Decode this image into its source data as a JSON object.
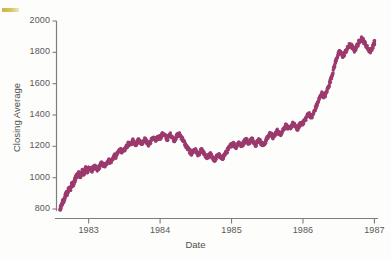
{
  "chart_data": {
    "type": "scatter",
    "title": "",
    "xlabel": "Date",
    "ylabel": "Closing Average",
    "xlim": [
      1982.55,
      1987.05
    ],
    "ylim": [
      760,
      2010
    ],
    "grid": false,
    "legend": null,
    "xtick_labels": [
      "1983",
      "1984",
      "1985",
      "1986",
      "1987"
    ],
    "xtick_values": [
      1983,
      1984,
      1985,
      1986,
      1987
    ],
    "ytick_labels": [
      "800",
      "1000",
      "1200",
      "1400",
      "1600",
      "1800",
      "2000"
    ],
    "ytick_values": [
      800,
      1000,
      1200,
      1400,
      1600,
      1800,
      2000
    ],
    "marker_color": "#9c3a6e",
    "marker_size": 1.7,
    "series_name": "Dow Jones closing average",
    "x": [
      1982.6,
      1982.61,
      1982.62,
      1982.63,
      1982.64,
      1982.65,
      1982.66,
      1982.67,
      1982.68,
      1982.69,
      1982.7,
      1982.71,
      1982.72,
      1982.73,
      1982.74,
      1982.75,
      1982.76,
      1982.77,
      1982.78,
      1982.79,
      1982.8,
      1982.81,
      1982.82,
      1982.83,
      1982.84,
      1982.85,
      1982.86,
      1982.87,
      1982.88,
      1982.89,
      1982.9,
      1982.91,
      1982.92,
      1982.93,
      1982.94,
      1982.95,
      1982.96,
      1982.97,
      1982.98,
      1982.99,
      1983.0,
      1983.02,
      1983.04,
      1983.06,
      1983.08,
      1983.1,
      1983.12,
      1983.14,
      1983.16,
      1983.18,
      1983.2,
      1983.22,
      1983.24,
      1983.26,
      1983.28,
      1983.3,
      1983.32,
      1983.34,
      1983.36,
      1983.38,
      1983.4,
      1983.42,
      1983.44,
      1983.46,
      1983.48,
      1983.5,
      1983.52,
      1983.54,
      1983.56,
      1983.58,
      1983.6,
      1983.62,
      1983.64,
      1983.66,
      1983.68,
      1983.7,
      1983.72,
      1983.74,
      1983.76,
      1983.78,
      1983.8,
      1983.82,
      1983.84,
      1983.86,
      1983.88,
      1983.9,
      1983.92,
      1983.94,
      1983.96,
      1983.98,
      1984.0,
      1984.02,
      1984.04,
      1984.06,
      1984.08,
      1984.1,
      1984.12,
      1984.14,
      1984.16,
      1984.18,
      1984.2,
      1984.22,
      1984.24,
      1984.26,
      1984.28,
      1984.3,
      1984.32,
      1984.34,
      1984.36,
      1984.38,
      1984.4,
      1984.42,
      1984.44,
      1984.46,
      1984.48,
      1984.5,
      1984.52,
      1984.54,
      1984.56,
      1984.58,
      1984.6,
      1984.62,
      1984.64,
      1984.66,
      1984.68,
      1984.7,
      1984.72,
      1984.74,
      1984.76,
      1984.78,
      1984.8,
      1984.82,
      1984.84,
      1984.86,
      1984.88,
      1984.9,
      1984.92,
      1984.94,
      1984.96,
      1984.98,
      1985.0,
      1985.02,
      1985.04,
      1985.06,
      1985.08,
      1985.1,
      1985.12,
      1985.14,
      1985.16,
      1985.18,
      1985.2,
      1985.22,
      1985.24,
      1985.26,
      1985.28,
      1985.3,
      1985.32,
      1985.34,
      1985.36,
      1985.38,
      1985.4,
      1985.42,
      1985.44,
      1985.46,
      1985.48,
      1985.5,
      1985.52,
      1985.54,
      1985.56,
      1985.58,
      1985.6,
      1985.62,
      1985.64,
      1985.66,
      1985.68,
      1985.7,
      1985.72,
      1985.74,
      1985.76,
      1985.78,
      1985.8,
      1985.82,
      1985.84,
      1985.86,
      1985.88,
      1985.9,
      1985.92,
      1985.94,
      1985.96,
      1985.98,
      1986.0,
      1986.02,
      1986.04,
      1986.06,
      1986.08,
      1986.1,
      1986.12,
      1986.14,
      1986.16,
      1986.18,
      1986.2,
      1986.22,
      1986.24,
      1986.26,
      1986.28,
      1986.3,
      1986.32,
      1986.34,
      1986.36,
      1986.38,
      1986.4,
      1986.42,
      1986.44,
      1986.46,
      1986.48,
      1986.5,
      1986.52,
      1986.54,
      1986.56,
      1986.58,
      1986.6,
      1986.62,
      1986.64,
      1986.66,
      1986.68,
      1986.7,
      1986.72,
      1986.74,
      1986.76,
      1986.78,
      1986.8,
      1986.82,
      1986.84,
      1986.86,
      1986.88,
      1986.9,
      1986.92,
      1986.94,
      1986.96,
      1986.98,
      1987.0
    ],
    "y": [
      795,
      808,
      822,
      838,
      852,
      845,
      862,
      878,
      890,
      903,
      896,
      912,
      928,
      941,
      920,
      934,
      950,
      962,
      948,
      958,
      975,
      990,
      1002,
      1015,
      1008,
      1022,
      1030,
      1018,
      1005,
      1016,
      1028,
      1042,
      1035,
      1020,
      1032,
      1048,
      1060,
      1045,
      1038,
      1052,
      1065,
      1055,
      1042,
      1058,
      1072,
      1060,
      1048,
      1062,
      1078,
      1090,
      1082,
      1070,
      1086,
      1100,
      1112,
      1098,
      1108,
      1125,
      1140,
      1132,
      1150,
      1168,
      1182,
      1172,
      1160,
      1175,
      1192,
      1205,
      1218,
      1208,
      1222,
      1238,
      1225,
      1212,
      1228,
      1242,
      1230,
      1218,
      1232,
      1245,
      1238,
      1222,
      1210,
      1225,
      1240,
      1255,
      1248,
      1235,
      1250,
      1262,
      1255,
      1268,
      1280,
      1272,
      1258,
      1245,
      1262,
      1275,
      1268,
      1252,
      1240,
      1255,
      1268,
      1280,
      1272,
      1258,
      1240,
      1222,
      1205,
      1190,
      1178,
      1165,
      1152,
      1168,
      1180,
      1172,
      1158,
      1145,
      1160,
      1175,
      1162,
      1148,
      1135,
      1122,
      1138,
      1150,
      1140,
      1126,
      1112,
      1125,
      1138,
      1148,
      1132,
      1118,
      1130,
      1145,
      1158,
      1172,
      1185,
      1198,
      1212,
      1222,
      1208,
      1195,
      1210,
      1225,
      1215,
      1202,
      1218,
      1232,
      1245,
      1235,
      1220,
      1232,
      1248,
      1238,
      1225,
      1212,
      1228,
      1242,
      1232,
      1218,
      1205,
      1218,
      1235,
      1252,
      1268,
      1282,
      1272,
      1258,
      1270,
      1285,
      1298,
      1288,
      1275,
      1290,
      1305,
      1320,
      1335,
      1322,
      1308,
      1318,
      1332,
      1345,
      1335,
      1322,
      1310,
      1325,
      1340,
      1352,
      1348,
      1362,
      1378,
      1395,
      1412,
      1398,
      1385,
      1402,
      1425,
      1448,
      1470,
      1492,
      1515,
      1538,
      1528,
      1512,
      1535,
      1560,
      1588,
      1615,
      1645,
      1678,
      1712,
      1745,
      1775,
      1792,
      1805,
      1788,
      1775,
      1790,
      1808,
      1822,
      1838,
      1852,
      1840,
      1825,
      1812,
      1828,
      1845,
      1862,
      1878,
      1892,
      1878,
      1862,
      1848,
      1832,
      1818,
      1805,
      1822,
      1840,
      1858,
      1872,
      1888,
      1902,
      1890,
      1875,
      1862,
      1878,
      1895,
      1912,
      1928
    ],
    "annotations": []
  },
  "axes": {
    "y_title": "Closing Average",
    "x_title": "Date"
  }
}
